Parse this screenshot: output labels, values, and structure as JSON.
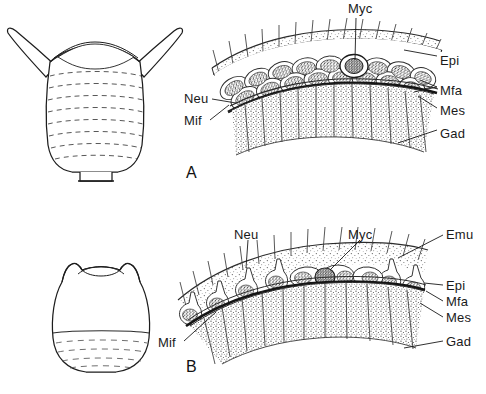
{
  "figure": {
    "caption_letters": [
      "A",
      "B"
    ],
    "background_color": "#ffffff",
    "ink_color": "#1a1a1a"
  },
  "panels": [
    {
      "letter": "A",
      "organism": {
        "name": "barrel-shaped-organism-relaxed",
        "description": "cup/barrel shaped body with two pointed horn projections at top and horizontal ring bands"
      },
      "section": {
        "name": "tissue-cross-section-a",
        "description": "arc-shaped magnified body wall showing epithelium, muscle fibre layer, mesogloea and gastrodermis"
      },
      "labels": [
        {
          "key": "myc",
          "text": "Myc",
          "x": 348,
          "y": 3,
          "anchor": "start"
        },
        {
          "key": "epi",
          "text": "Epi",
          "x": 440,
          "y": 55,
          "anchor": "start"
        },
        {
          "key": "mfa",
          "text": "Mfa",
          "x": 440,
          "y": 86,
          "anchor": "start"
        },
        {
          "key": "mes",
          "text": "Mes",
          "x": 440,
          "y": 106,
          "anchor": "start"
        },
        {
          "key": "gad",
          "text": "Gad",
          "x": 440,
          "y": 129,
          "anchor": "start"
        },
        {
          "key": "neu",
          "text": "Neu",
          "x": 186,
          "y": 96,
          "anchor": "start"
        },
        {
          "key": "mif",
          "text": "Mif",
          "x": 186,
          "y": 118,
          "anchor": "start"
        }
      ]
    },
    {
      "letter": "B",
      "organism": {
        "name": "barrel-shaped-organism-contracted",
        "description": "rounded barrel body with small shoulder bumps and hatched lower region"
      },
      "section": {
        "name": "tissue-cross-section-b",
        "description": "arc-shaped magnified body wall with flask-shaped neurosensory cells, myocytes, mesogloea and gastrodermis"
      },
      "labels": [
        {
          "key": "neu",
          "text": "Neu",
          "x": 236,
          "y": 231,
          "anchor": "start"
        },
        {
          "key": "myc",
          "text": "Myc",
          "x": 349,
          "y": 231,
          "anchor": "start"
        },
        {
          "key": "emu",
          "text": "Emu",
          "x": 446,
          "y": 231,
          "anchor": "start"
        },
        {
          "key": "epi",
          "text": "Epi",
          "x": 446,
          "y": 285,
          "anchor": "start"
        },
        {
          "key": "mfa",
          "text": "Mfa",
          "x": 446,
          "y": 301,
          "anchor": "start"
        },
        {
          "key": "mes",
          "text": "Mes",
          "x": 446,
          "y": 318,
          "anchor": "start"
        },
        {
          "key": "gad",
          "text": "Gad",
          "x": 446,
          "y": 341,
          "anchor": "start"
        },
        {
          "key": "mif",
          "text": "Mif",
          "x": 160,
          "y": 340,
          "anchor": "start"
        }
      ]
    }
  ],
  "panel_letters": [
    {
      "text": "A",
      "x": 186,
      "y": 172
    },
    {
      "text": "B",
      "x": 186,
      "y": 366
    }
  ]
}
